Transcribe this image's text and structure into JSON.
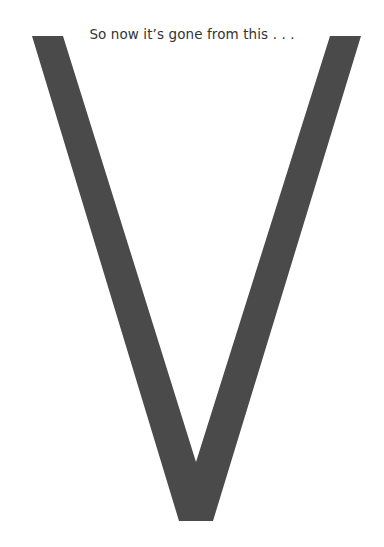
{
  "caption": "So now it’s gone from this . . .",
  "letter": {
    "glyph": "V",
    "color": "#4a4a4a"
  }
}
